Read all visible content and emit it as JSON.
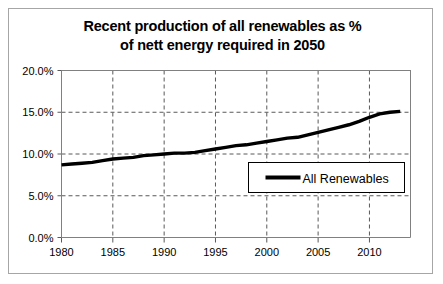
{
  "chart_data": {
    "type": "line",
    "title": "Recent production of all renewables as % of nett energy required in 2050",
    "title_line1": "Recent production of all renewables as %",
    "title_line2": "of nett energy required in 2050",
    "xlabel": "",
    "ylabel": "",
    "xlim": [
      1980,
      2014
    ],
    "ylim": [
      0,
      20
    ],
    "grid": true,
    "grid_style": "dashed",
    "legend_position": "inside-lower-right",
    "y_ticks": [
      0,
      5,
      10,
      15,
      20
    ],
    "y_tick_labels": [
      "0.0%",
      "5.0%",
      "10.0%",
      "15.0%",
      "20.0%"
    ],
    "x_ticks": [
      1980,
      1985,
      1990,
      1995,
      2000,
      2005,
      2010
    ],
    "x_tick_labels": [
      "1980",
      "1985",
      "1990",
      "1995",
      "2000",
      "2005",
      "2010"
    ],
    "series": [
      {
        "name": "All Renewables",
        "color": "#000000",
        "line_width": 3.4,
        "x": [
          1980,
          1981,
          1982,
          1983,
          1984,
          1985,
          1986,
          1987,
          1988,
          1989,
          1990,
          1991,
          1992,
          1993,
          1994,
          1995,
          1996,
          1997,
          1998,
          1999,
          2000,
          2001,
          2002,
          2003,
          2004,
          2005,
          2006,
          2007,
          2008,
          2009,
          2010,
          2011,
          2012,
          2013
        ],
        "values": [
          8.7,
          8.8,
          8.9,
          9.0,
          9.2,
          9.4,
          9.5,
          9.6,
          9.8,
          9.9,
          10.0,
          10.1,
          10.1,
          10.2,
          10.4,
          10.6,
          10.8,
          11.0,
          11.1,
          11.3,
          11.5,
          11.7,
          11.9,
          12.0,
          12.3,
          12.6,
          12.9,
          13.2,
          13.5,
          13.9,
          14.4,
          14.8,
          15.0,
          15.1
        ]
      }
    ]
  },
  "legend": {
    "entries": [
      {
        "label": "All Renewables"
      }
    ]
  }
}
